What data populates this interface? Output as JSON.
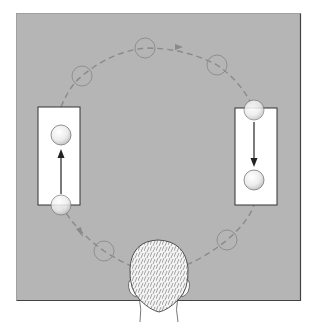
{
  "figure": {
    "colors": {
      "background": "#ffffff",
      "table": "#b5b5b5",
      "table_border": "#555555",
      "box": "#ffffff",
      "ghost_circle": "#8f8f8f",
      "path": "#8a8a8a",
      "arrow": "#333333",
      "ball": "#f2f2f2"
    },
    "table": {
      "x": 16,
      "y": 13,
      "w": 285,
      "h": 288
    },
    "boxes": [
      {
        "name": "left-box",
        "x": 38,
        "y": 107,
        "w": 42,
        "h": 98,
        "arrow_direction": "up"
      },
      {
        "name": "right-box",
        "x": 235,
        "y": 108,
        "w": 42,
        "h": 97,
        "arrow_direction": "down"
      }
    ],
    "balls": [
      {
        "name": "left-box-ball",
        "cx": 61,
        "cy": 135,
        "r": 10
      },
      {
        "name": "left-bottom-ball",
        "cx": 61,
        "cy": 205,
        "r": 10
      },
      {
        "name": "right-top-ball",
        "cx": 254,
        "cy": 110,
        "r": 10
      },
      {
        "name": "right-box-ball",
        "cx": 254,
        "cy": 180,
        "r": 10
      }
    ],
    "ghost_circles": [
      {
        "cx": 82,
        "cy": 76,
        "r": 10
      },
      {
        "cx": 145,
        "cy": 48,
        "r": 10
      },
      {
        "cx": 217,
        "cy": 65,
        "r": 10
      },
      {
        "cx": 104,
        "cy": 251,
        "r": 10
      },
      {
        "cx": 227,
        "cy": 240,
        "r": 10
      }
    ],
    "observer": {
      "label": "observer-head",
      "cx": 158,
      "top": 240
    }
  }
}
